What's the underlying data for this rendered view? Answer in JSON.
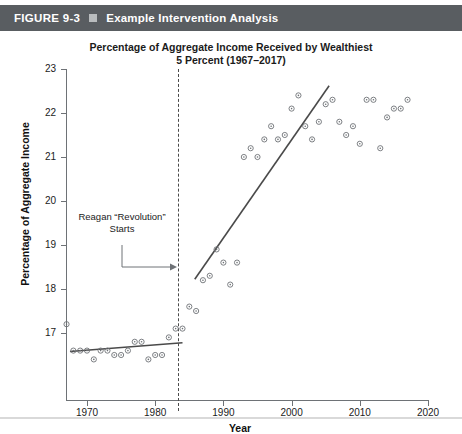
{
  "figure": {
    "label": "FIGURE 9-3",
    "bullet_icon": "square-bullet-icon",
    "title": "Example Intervention Analysis",
    "bar_color": "#595d61"
  },
  "chart_data": {
    "type": "scatter",
    "title": "Percentage of Aggregate Income Received by Wealthiest\n5 Percent (1967–2017)",
    "title_line1": "Percentage of Aggregate Income Received by Wealthiest",
    "title_line2": "5 Percent (1967–2017)",
    "xlabel": "Year",
    "ylabel": "Percentage of Aggregate Income",
    "xlim": [
      1966.5,
      2020.5
    ],
    "ylim": [
      16.2,
      23
    ],
    "xticks": [
      1970,
      1980,
      1990,
      2000,
      2010,
      2020
    ],
    "xtick_labels": [
      "1970",
      "1980",
      "1990",
      "2000",
      "2010",
      "2020"
    ],
    "yticks": [
      17,
      18,
      19,
      20,
      21,
      22,
      23
    ],
    "ytick_labels": [
      "17",
      "18",
      "19",
      "20",
      "21",
      "22",
      "23"
    ],
    "grid": false,
    "legend": "none",
    "marker": "circle-dot-marker",
    "marker_color": "#6e7276",
    "series": [
      {
        "name": "Percentage of aggregate income received by wealthiest 5 percent",
        "x": [
          1967,
          1968,
          1969,
          1970,
          1971,
          1972,
          1973,
          1974,
          1975,
          1976,
          1977,
          1978,
          1979,
          1980,
          1981,
          1982,
          1983,
          1984,
          1985,
          1986,
          1987,
          1988,
          1989,
          1990,
          1991,
          1992,
          1993,
          1994,
          1995,
          1996,
          1997,
          1998,
          1999,
          2000,
          2001,
          2002,
          2003,
          2004,
          2005,
          2006,
          2007,
          2008,
          2009,
          2010,
          2011,
          2012,
          2013,
          2014,
          2015,
          2016,
          2017
        ],
        "y": [
          17.2,
          16.6,
          16.6,
          16.6,
          16.4,
          16.6,
          16.6,
          16.5,
          16.5,
          16.6,
          16.8,
          16.8,
          16.4,
          16.5,
          16.5,
          16.9,
          17.1,
          17.1,
          17.6,
          17.5,
          18.2,
          18.3,
          18.9,
          18.6,
          18.1,
          18.6,
          21.0,
          21.2,
          21.0,
          21.4,
          21.7,
          21.4,
          21.5,
          22.1,
          22.4,
          21.7,
          21.4,
          21.8,
          22.2,
          22.3,
          21.8,
          21.5,
          21.7,
          21.3,
          22.3,
          22.3,
          21.2,
          21.9,
          22.1,
          22.1,
          22.3
        ]
      }
    ],
    "trend_lines": [
      {
        "name": "pre-intervention-trend",
        "x1": 1967.5,
        "y1": 16.58,
        "x2": 1984.0,
        "y2": 16.78,
        "color": "#4a4a4a"
      },
      {
        "name": "post-intervention-trend",
        "x1": 1985.8,
        "y1": 18.22,
        "x2": 2005.5,
        "y2": 22.62,
        "color": "#4a4a4a"
      }
    ],
    "intervention_line": {
      "name": "reagan-revolution-marker",
      "x": 1983.4,
      "style": "dashed",
      "color": "#4a4a4a"
    },
    "annotation": {
      "line1": "Reagan “Revolution”",
      "line2": "Starts",
      "arrow": "elbow-arrow-right",
      "points_to_year": 1983.4
    }
  }
}
